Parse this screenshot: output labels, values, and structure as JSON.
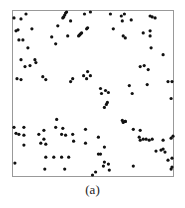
{
  "chart_data": {
    "type": "scatter",
    "title": "",
    "caption": "(a)",
    "xlabel": "",
    "ylabel": "",
    "xlim": [
      0,
      1
    ],
    "ylim": [
      0,
      1
    ],
    "grid": false,
    "axes_ticks": false,
    "legend": null,
    "marker_color": "#111111",
    "frame_color": "#999999",
    "points": [
      [
        0.006,
        0.958
      ],
      [
        0.05,
        0.952
      ],
      [
        0.081,
        0.982
      ],
      [
        0.031,
        0.886
      ],
      [
        0.019,
        0.88
      ],
      [
        0.037,
        0.825
      ],
      [
        0.062,
        0.825
      ],
      [
        0.118,
        0.892
      ],
      [
        0.093,
        0.777
      ],
      [
        0.05,
        0.705
      ],
      [
        0.137,
        0.705
      ],
      [
        0.317,
        0.964
      ],
      [
        0.311,
        0.958
      ],
      [
        0.323,
        0.976
      ],
      [
        0.329,
        0.988
      ],
      [
        0.335,
        0.994
      ],
      [
        0.28,
        0.91
      ],
      [
        0.242,
        0.843
      ],
      [
        0.267,
        0.801
      ],
      [
        0.342,
        0.849
      ],
      [
        0.36,
        0.94
      ],
      [
        0.416,
        0.855
      ],
      [
        0.41,
        0.849
      ],
      [
        0.422,
        0.861
      ],
      [
        0.429,
        0.867
      ],
      [
        0.46,
        0.892
      ],
      [
        0.466,
        0.898
      ],
      [
        0.447,
        0.982
      ],
      [
        0.484,
        0.994
      ],
      [
        0.609,
        0.982
      ],
      [
        0.677,
        0.97
      ],
      [
        0.696,
        0.982
      ],
      [
        0.683,
        0.94
      ],
      [
        0.739,
        0.946
      ],
      [
        0.627,
        0.892
      ],
      [
        0.689,
        0.849
      ],
      [
        0.702,
        0.837
      ],
      [
        0.814,
        0.867
      ],
      [
        0.857,
        0.97
      ],
      [
        0.87,
        0.964
      ],
      [
        0.888,
        0.958
      ],
      [
        0.857,
        0.88
      ],
      [
        0.857,
        0.849
      ],
      [
        0.863,
        0.777
      ],
      [
        0.938,
        0.735
      ],
      [
        0.025,
        0.59
      ],
      [
        0.05,
        0.584
      ],
      [
        0.075,
        0.663
      ],
      [
        0.106,
        0.669
      ],
      [
        0.143,
        0.687
      ],
      [
        0.186,
        0.602
      ],
      [
        0.205,
        0.584
      ],
      [
        0.36,
        0.572
      ],
      [
        0.373,
        0.59
      ],
      [
        0.484,
        0.608
      ],
      [
        0.466,
        0.633
      ],
      [
        0.441,
        0.608
      ],
      [
        0.46,
        0.59
      ],
      [
        0.547,
        0.53
      ],
      [
        0.578,
        0.518
      ],
      [
        0.596,
        0.506
      ],
      [
        0.553,
        0.5
      ],
      [
        0.727,
        0.548
      ],
      [
        0.745,
        0.5
      ],
      [
        0.795,
        0.663
      ],
      [
        0.82,
        0.669
      ],
      [
        0.845,
        0.645
      ],
      [
        0.839,
        0.554
      ],
      [
        0.969,
        0.572
      ],
      [
        0.994,
        0.572
      ],
      [
        0.988,
        0.47
      ],
      [
        0.571,
        0.416
      ],
      [
        0.584,
        0.434
      ],
      [
        0.59,
        0.446
      ],
      [
        0.702,
        0.331
      ],
      [
        0.689,
        0.325
      ],
      [
        0.006,
        0.295
      ],
      [
        0.019,
        0.259
      ],
      [
        0.037,
        0.253
      ],
      [
        0.068,
        0.295
      ],
      [
        0.068,
        0.247
      ],
      [
        0.068,
        0.187
      ],
      [
        0.193,
        0.277
      ],
      [
        0.161,
        0.253
      ],
      [
        0.174,
        0.199
      ],
      [
        0.193,
        0.223
      ],
      [
        0.205,
        0.193
      ],
      [
        0.267,
        0.295
      ],
      [
        0.273,
        0.343
      ],
      [
        0.311,
        0.289
      ],
      [
        0.304,
        0.253
      ],
      [
        0.329,
        0.247
      ],
      [
        0.373,
        0.253
      ],
      [
        0.379,
        0.211
      ],
      [
        0.453,
        0.283
      ],
      [
        0.453,
        0.199
      ],
      [
        0.534,
        0.235
      ],
      [
        0.571,
        0.175
      ],
      [
        0.012,
        0.078
      ],
      [
        0.199,
        0.042
      ],
      [
        0.205,
        0.114
      ],
      [
        0.255,
        0.114
      ],
      [
        0.304,
        0.114
      ],
      [
        0.348,
        0.114
      ],
      [
        0.323,
        0.042
      ],
      [
        0.534,
        0.133
      ],
      [
        0.547,
        0.133
      ],
      [
        0.565,
        0.06
      ],
      [
        0.516,
        0.024
      ],
      [
        0.497,
        0.006
      ],
      [
        0.571,
        0.084
      ],
      [
        0.596,
        0.072
      ],
      [
        0.602,
        0.036
      ],
      [
        0.683,
        0.337
      ],
      [
        0.702,
        0.331
      ],
      [
        0.752,
        0.283
      ],
      [
        0.795,
        0.277
      ],
      [
        0.789,
        0.235
      ],
      [
        0.795,
        0.217
      ],
      [
        0.814,
        0.223
      ],
      [
        0.832,
        0.223
      ],
      [
        0.851,
        0.217
      ],
      [
        0.87,
        0.223
      ],
      [
        0.938,
        0.217
      ],
      [
        1.0,
        0.241
      ],
      [
        0.988,
        0.229
      ],
      [
        0.894,
        0.151
      ],
      [
        0.925,
        0.157
      ],
      [
        0.938,
        0.163
      ],
      [
        0.95,
        0.145
      ],
      [
        0.969,
        0.096
      ],
      [
        0.988,
        0.042
      ],
      [
        0.994,
        0.054
      ],
      [
        0.752,
        0.06
      ],
      [
        0.994,
        0.108
      ]
    ]
  }
}
